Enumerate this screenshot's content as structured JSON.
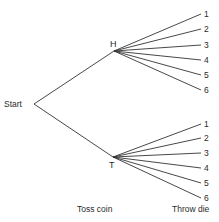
{
  "diagram": {
    "type": "tree",
    "root": {
      "label": "Start"
    },
    "coin_outcomes": [
      {
        "label": "H",
        "die_outcomes": [
          "1",
          "2",
          "3",
          "4",
          "5",
          "6"
        ]
      },
      {
        "label": "T",
        "die_outcomes": [
          "1",
          "2",
          "3",
          "4",
          "5",
          "6"
        ]
      }
    ],
    "stage_labels": {
      "stage1": "Toss coin",
      "stage2": "Throw die"
    }
  }
}
